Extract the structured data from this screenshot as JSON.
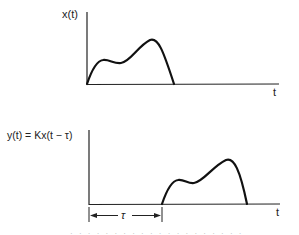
{
  "top_graph": {
    "ylabel": "x(t)",
    "xlabel": "t",
    "curve_points": [
      [
        87,
        84
      ],
      [
        95,
        66
      ],
      [
        103,
        60
      ],
      [
        112,
        62
      ],
      [
        120,
        63
      ],
      [
        130,
        57
      ],
      [
        140,
        48
      ],
      [
        150,
        40
      ],
      [
        157,
        44
      ],
      [
        164,
        58
      ],
      [
        170,
        72
      ],
      [
        174,
        84
      ]
    ]
  },
  "bottom_graph": {
    "ylabel": "y(t) = Kx(t − τ)",
    "xlabel": "t",
    "delay_label": "τ",
    "curve_points": [
      [
        162,
        204
      ],
      [
        170,
        186
      ],
      [
        178,
        180
      ],
      [
        186,
        182
      ],
      [
        193,
        183
      ],
      [
        203,
        177
      ],
      [
        215,
        166
      ],
      [
        226,
        160
      ],
      [
        234,
        165
      ],
      [
        240,
        178
      ],
      [
        244,
        192
      ],
      [
        247,
        204
      ]
    ]
  },
  "caption_fragment": "· ·  · · ·  · · · · · · ·  · · · · · · · ·"
}
